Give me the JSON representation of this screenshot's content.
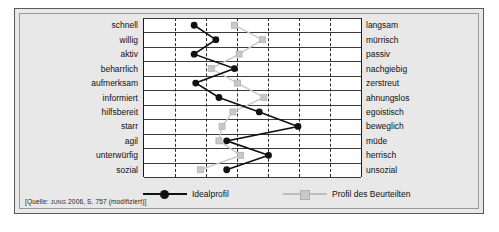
{
  "figure": {
    "source_note_prefix": "[Quelle: ",
    "source_author": "JUNG",
    "source_rest": " 2006, S. 757 (modifiziert)]"
  },
  "legend": {
    "entries": [
      {
        "label": "Idealprofil",
        "marker": "circle",
        "color": "#111111"
      },
      {
        "label": "Profil des Beurteilten",
        "marker": "square",
        "color": "#c8c8c8"
      }
    ]
  },
  "chart_data": {
    "type": "line",
    "title": "",
    "subtitle": "",
    "xlabel": "",
    "ylabel": "",
    "orientation": "horizontal-polarity-profile",
    "grid": true,
    "legend_position": "bottom",
    "xlim": [
      0,
      7
    ],
    "x_gridlines": [
      1,
      2,
      3,
      4,
      5,
      6
    ],
    "categories_left": [
      "schnell",
      "willig",
      "aktiv",
      "beharrlich",
      "aufmerksam",
      "informiert",
      "hilfsbereit",
      "starr",
      "agil",
      "unterwürfig",
      "sozial"
    ],
    "categories_right": [
      "langsam",
      "mürrisch",
      "passiv",
      "nachgiebig",
      "zerstreut",
      "ahnungslos",
      "egoistisch",
      "beweglich",
      "müde",
      "herrisch",
      "unsozial"
    ],
    "series": [
      {
        "name": "Idealprofil",
        "marker": "circle",
        "color": "#111111",
        "values": [
          1.65,
          2.35,
          1.65,
          2.95,
          1.7,
          2.45,
          3.75,
          5.0,
          2.7,
          4.05,
          2.7
        ]
      },
      {
        "name": "Profil des Beurteilten",
        "marker": "square",
        "color": "#c8c8c8",
        "values": [
          2.95,
          3.85,
          3.1,
          2.2,
          3.05,
          3.9,
          2.9,
          2.55,
          2.45,
          3.15,
          1.85
        ]
      }
    ]
  }
}
